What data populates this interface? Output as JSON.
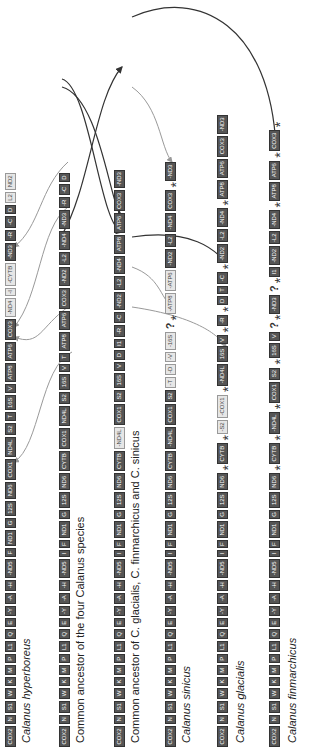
{
  "figure": {
    "orientation": "rotated-90-ccw"
  },
  "rows": [
    {
      "id": "hyperboreus",
      "label": "Calanus hyperboreus",
      "italic": true,
      "genes": [
        "COX2",
        "N",
        "S1",
        "W",
        "K",
        "M",
        "P",
        "L1",
        "Q",
        "E",
        "-Y",
        "-A",
        "-H",
        "-ND5",
        "F",
        "ND1",
        "G",
        "12S",
        "ND6",
        "COX1",
        "ND4L",
        "S2",
        "T",
        "16S",
        "V",
        "ATP8",
        "ATP6",
        "COX3",
        "-ND4",
        "-I",
        "-CYTB",
        "-ND3",
        "-R",
        "-C",
        "D",
        "L2",
        "ND2"
      ]
    },
    {
      "id": "ancestor-four",
      "label": "Common ancestor of the four Calanus species",
      "italic": false,
      "genes": [
        "COX2",
        "N",
        "S1",
        "W",
        "K",
        "M",
        "P",
        "L1",
        "Q",
        "E",
        "-Y",
        "-A",
        "-H",
        "-ND5",
        "I",
        "F",
        "ND1",
        "G",
        "12S",
        "ND6",
        "CYTB",
        "COX1",
        "ND4L",
        "S2",
        "16S",
        "V",
        "T",
        "ATP8",
        "ATP6",
        "COX3",
        "-ND2",
        "-L2",
        "-ND4",
        "-ND3",
        "-R",
        "-C",
        "D"
      ]
    },
    {
      "id": "ancestor-three",
      "label": "Common ancestor of C. glacialis, C. finmarchicus and C. sinicus",
      "italic": false,
      "genes": [
        "COX2",
        "N",
        "S1",
        "W",
        "K",
        "M",
        "P",
        "L1",
        "Q",
        "E",
        "-Y",
        "-A",
        "-H",
        "-ND5",
        "I",
        "F",
        "ND1",
        "G",
        "12S",
        "ND6",
        "CYTB",
        "-ND4L",
        "COX1",
        "S2",
        "16S",
        "V",
        "D",
        "I1",
        "-R",
        "-C",
        "-ND2",
        "-L2",
        "-ND4",
        "ATP8",
        "ATP6",
        "COX3",
        "-ND3"
      ]
    },
    {
      "id": "sinicus",
      "label": "Calanus sinicus",
      "italic": true,
      "genes": [
        "COX2",
        "N",
        "S1",
        "W",
        "K",
        "M",
        "P",
        "L1",
        "Q",
        "E",
        "-Y",
        "-A",
        "-H",
        "-ND5",
        "I",
        "F",
        "ND1",
        "G",
        "12S",
        "ND6",
        "CYTB",
        "-ND4L",
        "COX1",
        "S2",
        "-T",
        "-D",
        "-V",
        "-16S",
        "?",
        "*",
        "-ATP8",
        "-ATP6",
        "-ND2",
        "-L2",
        "-ND4",
        "COX3",
        "*",
        "-ND3"
      ]
    },
    {
      "id": "glacialis",
      "label": "Calanus glacialis",
      "italic": true,
      "genes": [
        "COX2",
        "N",
        "S1",
        "W",
        "K",
        "M",
        "P",
        "L1",
        "Q",
        "E",
        "-Y",
        "-A",
        "-H",
        "-ND5",
        "I",
        "F",
        "ND1",
        "G",
        "12S",
        "ND6",
        "*",
        "CYTB",
        "*",
        "-S2",
        "-COX1",
        "*",
        "-ND4L",
        "16S",
        "V",
        "*",
        "-R",
        "*",
        "D",
        "T",
        "-C",
        "*",
        "-ND2",
        "-L2",
        "-ND4",
        "*",
        "ATP8",
        "ATP6",
        "COX3",
        "-ND3"
      ]
    },
    {
      "id": "finmarchicus",
      "label": "Calanus finmarchicus",
      "italic": true,
      "genes": [
        "COX2",
        "N",
        "S1",
        "W",
        "K",
        "M",
        "P",
        "L1",
        "Q",
        "E",
        "-Y",
        "-A",
        "-H",
        "-ND5",
        "I",
        "F",
        "ND1",
        "G",
        "12S",
        "ND6",
        "*",
        "CYTB",
        "*",
        "-ND4L",
        "*",
        "COX1",
        "S2",
        "*",
        "16S",
        "V",
        "?",
        "*",
        "-ND3",
        "?",
        "*",
        "I1",
        "-ND2",
        "-L2",
        "-ND4",
        "*",
        "ATP8",
        "ATP6",
        "*",
        "COX3",
        "*"
      ]
    }
  ],
  "markers": {
    "asterisk": "*",
    "unknown": "?"
  }
}
